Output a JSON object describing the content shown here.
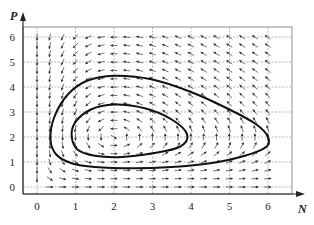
{
  "chart_data": {
    "type": "line",
    "title": "",
    "xlabel": "N",
    "ylabel": "P",
    "xlim": [
      -0.4,
      6.8
    ],
    "ylim": [
      -0.3,
      6.4
    ],
    "grid": true,
    "legend": null,
    "xticks": [
      "0",
      "1",
      "2",
      "3",
      "4",
      "5",
      "6"
    ],
    "yticks": [
      "0",
      "1",
      "2",
      "3",
      "4",
      "5",
      "6"
    ],
    "vector_field": {
      "description": "Predator-prey direction field (Lotka-Volterra type), equilibrium near N=2, P=2",
      "dN_dt": "N*(1 - P/2)",
      "dP_dt": "P*(N/2 - 1)",
      "grid_N": [
        0,
        6,
        0.333
      ],
      "grid_P": [
        0,
        6,
        0.333
      ]
    },
    "series": [
      {
        "name": "outer-orbit",
        "points": [
          [
            0.35,
            1.9
          ],
          [
            0.45,
            2.8
          ],
          [
            0.8,
            3.7
          ],
          [
            1.3,
            4.25
          ],
          [
            2.0,
            4.45
          ],
          [
            3.0,
            4.3
          ],
          [
            4.0,
            3.8
          ],
          [
            5.0,
            3.1
          ],
          [
            5.7,
            2.5
          ],
          [
            6.0,
            2.0
          ],
          [
            5.95,
            1.6
          ],
          [
            5.4,
            1.25
          ],
          [
            4.5,
            0.95
          ],
          [
            3.5,
            0.8
          ],
          [
            2.5,
            0.75
          ],
          [
            1.5,
            0.8
          ],
          [
            0.9,
            0.95
          ],
          [
            0.5,
            1.3
          ],
          [
            0.35,
            1.9
          ]
        ]
      },
      {
        "name": "inner-orbit",
        "points": [
          [
            0.9,
            2.05
          ],
          [
            1.0,
            2.6
          ],
          [
            1.4,
            3.1
          ],
          [
            2.0,
            3.3
          ],
          [
            2.8,
            3.15
          ],
          [
            3.5,
            2.7
          ],
          [
            3.9,
            2.1
          ],
          [
            3.7,
            1.6
          ],
          [
            3.0,
            1.35
          ],
          [
            2.2,
            1.2
          ],
          [
            1.5,
            1.25
          ],
          [
            1.05,
            1.5
          ],
          [
            0.9,
            2.05
          ]
        ]
      }
    ]
  },
  "axes": {
    "x_label": "N",
    "y_label": "P"
  }
}
